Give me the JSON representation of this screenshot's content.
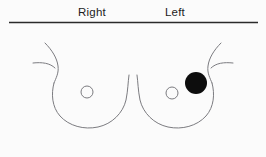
{
  "figure": {
    "width": 266,
    "height": 157,
    "background_color": "#fbfbfb",
    "type": "breast-diagram",
    "header": {
      "right_label": "Right",
      "left_label": "Left",
      "divider_present": true
    },
    "outline_color": "#7b7b80",
    "lesion_color": "#0d0d0d",
    "divider_color": "#2b2b2b",
    "breasts": [
      {
        "side": "Right",
        "nipple": {
          "cx": 87,
          "cy": 92,
          "r": 6
        },
        "lesions": []
      },
      {
        "side": "Left",
        "nipple": {
          "cx": 172,
          "cy": 93,
          "r": 6
        },
        "lesions": [
          {
            "name": "mass",
            "cx": 196,
            "cy": 83,
            "r": 11,
            "fill": "#0d0d0d",
            "quadrant": "upper-outer"
          }
        ]
      }
    ]
  }
}
